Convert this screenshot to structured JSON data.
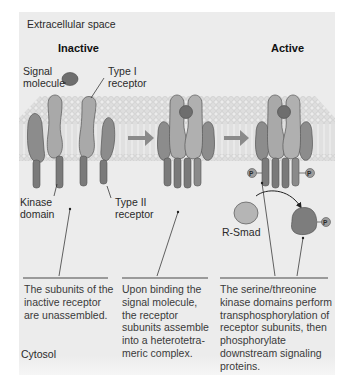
{
  "regions": {
    "top": "Extracellular space",
    "bottom": "Cytosol"
  },
  "states": {
    "inactive": "Inactive",
    "active": "Active"
  },
  "labels": {
    "signal_molecule_line1": "Signal",
    "signal_molecule_line2": "molecule",
    "type1_line1": "Type I",
    "type1_line2": "receptor",
    "type2_line1": "Type II",
    "type2_line2": "receptor",
    "kinase_line1": "Kinase",
    "kinase_line2": "domain",
    "rsmad": "R-Smad",
    "phosphate": "P"
  },
  "captions": [
    {
      "lines": [
        "The subunits of the",
        "inactive receptor",
        "are unassembled."
      ]
    },
    {
      "lines": [
        "Upon binding the",
        "signal molecule,",
        "the receptor",
        "subunits assemble",
        "into a heterotetra-",
        "meric complex."
      ]
    },
    {
      "lines": [
        "The serine/threonine",
        "kinase domains perform",
        "transphosphorylation of",
        "receptor subunits, then",
        "phosphorylate",
        "downstream signaling",
        "proteins."
      ]
    }
  ],
  "colors": {
    "background_panel": "#ececec",
    "membrane": "#d9d9d9",
    "type1_receptor": "#a9a9a9",
    "type2_receptor": "#8c8c8c",
    "kinase": "#7a7a7a",
    "signal_molecule": "#6e6e6e",
    "arrow": "#8a8a8a",
    "phosphate": "#9c9c9c",
    "rsmad": "#b5b5b5",
    "rsmad_phospho": "#7d7d7d"
  }
}
